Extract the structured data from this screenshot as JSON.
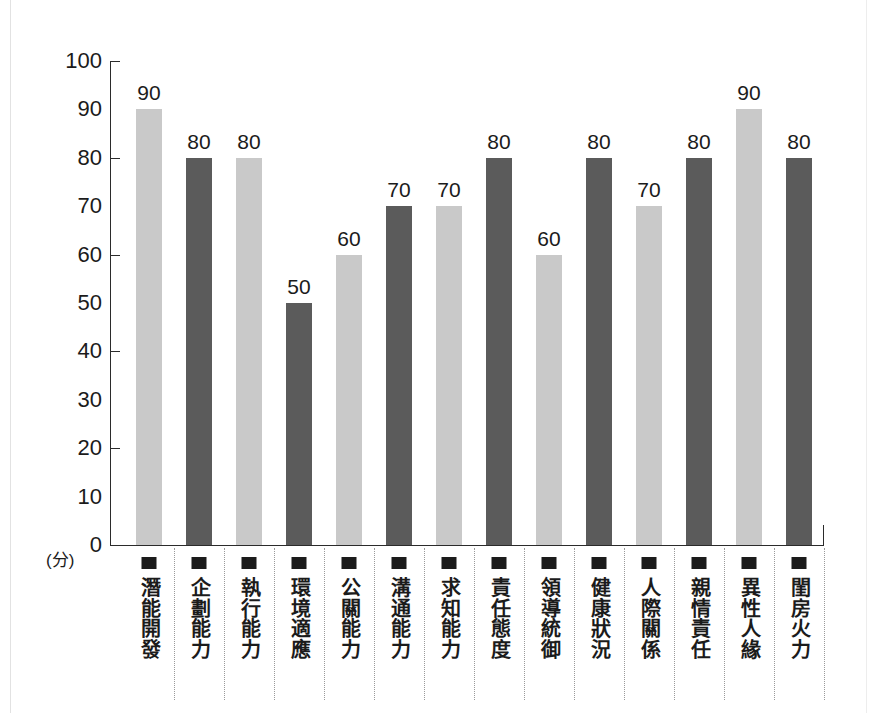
{
  "chart_data": {
    "type": "bar",
    "title": "",
    "subtitle": "",
    "xlabel": "",
    "ylabel": "(分)",
    "ylim": [
      0,
      100
    ],
    "ytick_step": 10,
    "ytick_mark_step": 20,
    "grid": false,
    "legend": "none",
    "categories": [
      "潛能開發",
      "企劃能力",
      "執行能力",
      "環境適應",
      "公關能力",
      "溝通能力",
      "求知能力",
      "責任態度",
      "領導統御",
      "健康狀況",
      "人際關係",
      "親情責任",
      "異性人緣",
      "閨房火力"
    ],
    "values": [
      90,
      80,
      80,
      50,
      60,
      70,
      70,
      80,
      60,
      80,
      70,
      80,
      90,
      80
    ],
    "bar_shades": [
      "light",
      "dark",
      "light",
      "dark",
      "light",
      "dark",
      "light",
      "dark",
      "light",
      "dark",
      "light",
      "dark",
      "light",
      "dark"
    ],
    "ytick_labels": [
      "100",
      "90",
      "80",
      "70",
      "60",
      "50",
      "40",
      "30",
      "20",
      "10",
      "0"
    ],
    "ytick_values": [
      100,
      90,
      80,
      70,
      60,
      50,
      40,
      30,
      20,
      10,
      0
    ],
    "ytick_marked": [
      true,
      false,
      true,
      false,
      true,
      false,
      true,
      false,
      true,
      false,
      false
    ],
    "colors": {
      "bar_light": "#c9c9c9",
      "bar_dark": "#5b5b5b",
      "axis": "#2b2b2b",
      "text": "#1b1b1b",
      "separator": "#9a9a9a",
      "background": "#ffffff",
      "marker": "#1b1b1b"
    }
  }
}
